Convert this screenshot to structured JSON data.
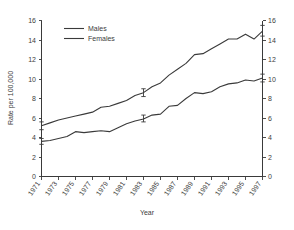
{
  "chart_data": {
    "type": "line",
    "title": "",
    "xlabel": "Year",
    "ylabel": "Rate per 100,000",
    "xlim": [
      1971,
      1997
    ],
    "ylim": [
      0,
      16
    ],
    "ytick_step": 2,
    "yticks": [
      0,
      2,
      4,
      6,
      8,
      10,
      12,
      14,
      16
    ],
    "ytick_labels": [
      "0",
      "2",
      "4",
      "6",
      "8",
      "10",
      "12",
      "14",
      "16"
    ],
    "right_axis": true,
    "right_yticks": [
      0,
      2,
      4,
      6,
      8,
      10,
      12,
      14,
      16
    ],
    "right_ytick_labels": [
      "0",
      "2",
      "4",
      "6",
      "8",
      "10",
      "12",
      "14",
      "16"
    ],
    "grid": false,
    "legend_position": "top-left-inside",
    "x": [
      1971,
      1972,
      1973,
      1974,
      1975,
      1976,
      1977,
      1978,
      1979,
      1980,
      1981,
      1982,
      1983,
      1984,
      1985,
      1986,
      1987,
      1988,
      1989,
      1990,
      1991,
      1992,
      1993,
      1994,
      1995,
      1996,
      1997
    ],
    "xticks": [
      1971,
      1973,
      1975,
      1977,
      1979,
      1981,
      1983,
      1985,
      1987,
      1989,
      1991,
      1993,
      1995,
      1997
    ],
    "xtick_labels": [
      "1971",
      "1973",
      "1975",
      "1977",
      "1979",
      "1981",
      "1983",
      "1985",
      "1987",
      "1989",
      "1991",
      "1993",
      "1995",
      "1997"
    ],
    "series": [
      {
        "name": "Males",
        "values": [
          5.2,
          5.5,
          5.8,
          6.0,
          6.2,
          6.4,
          6.6,
          7.1,
          7.2,
          7.5,
          7.8,
          8.3,
          8.6,
          9.2,
          9.6,
          10.4,
          11.0,
          11.6,
          12.5,
          12.6,
          13.1,
          13.6,
          14.1,
          14.1,
          14.6,
          14.1,
          14.9
        ],
        "error_bars": [
          {
            "x": 1971,
            "y": 5.2,
            "low": 4.8,
            "high": 5.6
          },
          {
            "x": 1983,
            "y": 8.6,
            "low": 8.2,
            "high": 9.0
          },
          {
            "x": 1997,
            "y": 14.9,
            "low": 14.4,
            "high": 15.5
          }
        ]
      },
      {
        "name": "Females",
        "values": [
          3.6,
          3.7,
          3.9,
          4.1,
          4.6,
          4.5,
          4.6,
          4.7,
          4.6,
          5.0,
          5.4,
          5.7,
          5.9,
          6.3,
          6.4,
          7.2,
          7.3,
          8.0,
          8.6,
          8.5,
          8.7,
          9.2,
          9.5,
          9.6,
          9.9,
          9.8,
          10.1
        ],
        "error_bars": [
          {
            "x": 1971,
            "y": 3.6,
            "low": 3.3,
            "high": 3.9
          },
          {
            "x": 1983,
            "y": 5.9,
            "low": 5.6,
            "high": 6.3
          },
          {
            "x": 1997,
            "y": 10.1,
            "low": 9.7,
            "high": 10.5
          }
        ]
      }
    ],
    "legend": [
      "Males",
      "Females"
    ],
    "colors": {
      "line": "#3a3a3a",
      "axis": "#3a3a3a",
      "text": "#3d3d3d",
      "background": "#ffffff"
    }
  }
}
